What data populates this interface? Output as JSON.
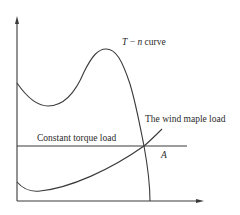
{
  "diagram": {
    "labels": {
      "tn_curve_T": "T",
      "tn_curve_dash": " − ",
      "tn_curve_n": "n",
      "tn_curve_suffix": " curve",
      "wind_load": "The wind maple load",
      "constant_torque": "Constant torque load",
      "intersection": "A"
    },
    "colors": {
      "line": "#3a3a3a",
      "text": "#2a2a2a",
      "background": "#ffffff"
    }
  }
}
